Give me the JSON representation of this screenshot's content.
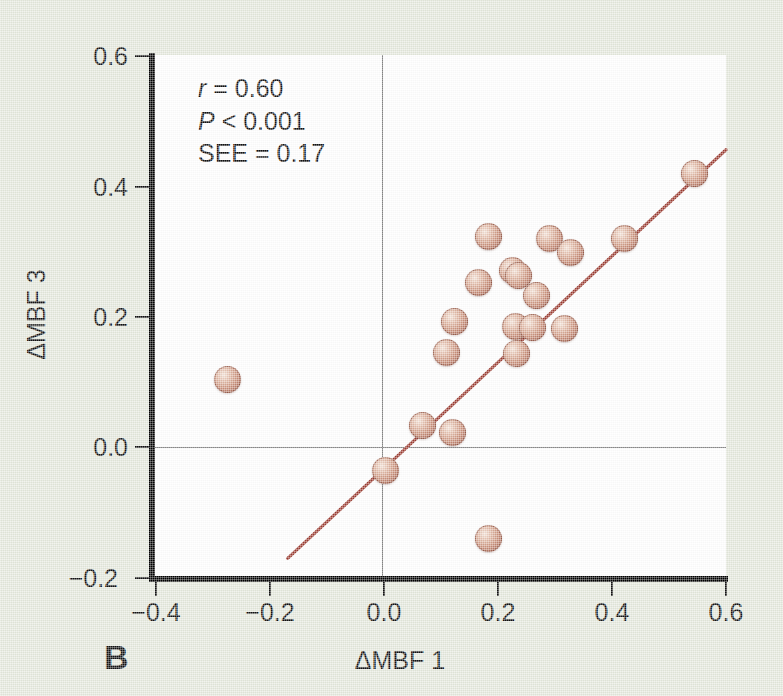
{
  "figure": {
    "panel_letter": "B",
    "background_color": "#e4e8dc",
    "plot_background": "#ffffff",
    "marker_color": "#c98f79",
    "line_color": "#9b3b30",
    "axis_color": "#000000"
  },
  "annotations": {
    "r_symbol": "r",
    "r_text": " = 0.60",
    "p_symbol": "P",
    "p_text": " < 0.001",
    "see_text": "SEE = 0.17"
  },
  "chart_data": {
    "type": "scatter",
    "title": "",
    "xlabel": "ΔMBF 1",
    "ylabel": "ΔMBF 3",
    "xlim": [
      -0.4,
      0.6
    ],
    "ylim": [
      -0.2,
      0.6
    ],
    "xticks": [
      -0.4,
      -0.2,
      0.0,
      0.2,
      0.4,
      0.6
    ],
    "yticks": [
      -0.2,
      0.0,
      0.2,
      0.4,
      0.6
    ],
    "xticklabels": [
      "−0.4",
      "−0.2",
      "0.0",
      "0.2",
      "0.4",
      "0.6"
    ],
    "yticklabels": [
      "−0.2",
      "0.0",
      "0.2",
      "0.4",
      "0.6"
    ],
    "grid": false,
    "legend": null,
    "zero_reference_lines": {
      "x": 0.0,
      "y": 0.0
    },
    "statistics": {
      "r": 0.6,
      "p": "<0.001",
      "SEE": 0.17
    },
    "points": [
      {
        "x": -0.27,
        "y": 0.104
      },
      {
        "x": 0.07,
        "y": 0.033
      },
      {
        "x": 0.122,
        "y": 0.022
      },
      {
        "x": 0.005,
        "y": -0.035
      },
      {
        "x": 0.185,
        "y": -0.14
      },
      {
        "x": 0.112,
        "y": 0.145
      },
      {
        "x": 0.127,
        "y": 0.193
      },
      {
        "x": 0.232,
        "y": 0.185
      },
      {
        "x": 0.235,
        "y": 0.143
      },
      {
        "x": 0.262,
        "y": 0.183
      },
      {
        "x": 0.318,
        "y": 0.182
      },
      {
        "x": 0.27,
        "y": 0.232
      },
      {
        "x": 0.168,
        "y": 0.252
      },
      {
        "x": 0.228,
        "y": 0.27
      },
      {
        "x": 0.238,
        "y": 0.262
      },
      {
        "x": 0.185,
        "y": 0.322
      },
      {
        "x": 0.292,
        "y": 0.32
      },
      {
        "x": 0.328,
        "y": 0.298
      },
      {
        "x": 0.423,
        "y": 0.32
      },
      {
        "x": 0.545,
        "y": 0.418
      }
    ],
    "fit_line": {
      "x_start": -0.165,
      "y_start": -0.17,
      "x_end": 0.6,
      "y_end": 0.455
    }
  }
}
